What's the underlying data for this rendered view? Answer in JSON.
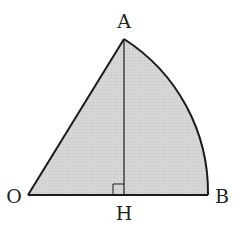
{
  "figure": {
    "points": {
      "O": {
        "label": "O",
        "x": 28,
        "y": 195
      },
      "A": {
        "label": "A",
        "x": 124,
        "y": 39
      },
      "H": {
        "label": "H",
        "x": 124,
        "y": 195
      },
      "B": {
        "label": "B",
        "x": 208,
        "y": 195
      }
    },
    "labels": {
      "A": "A",
      "O": "O",
      "H": "H",
      "B": "B"
    },
    "colors": {
      "fill": "#d4d4d4",
      "stroke": "#1a1a1a",
      "background": "#ffffff"
    },
    "right_angle_marker_at": "H"
  }
}
